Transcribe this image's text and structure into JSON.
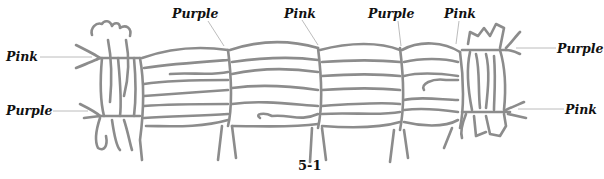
{
  "figure": {
    "caption": "5-1",
    "line_color": "#8c8c8c",
    "labels": [
      {
        "id": "left-top",
        "text": "Pink"
      },
      {
        "id": "left-bottom",
        "text": "Purple"
      },
      {
        "id": "top-1",
        "text": "Purple"
      },
      {
        "id": "top-2",
        "text": "Pink"
      },
      {
        "id": "top-3",
        "text": "Purple"
      },
      {
        "id": "top-4",
        "text": "Pink"
      },
      {
        "id": "right-top",
        "text": "Purple"
      },
      {
        "id": "right-bottom",
        "text": "Pink"
      }
    ]
  }
}
